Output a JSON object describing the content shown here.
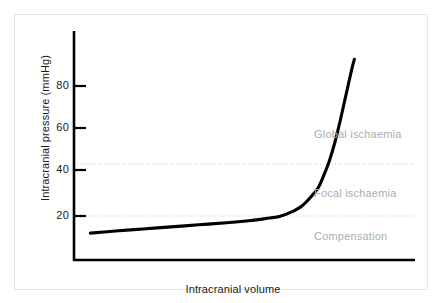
{
  "chart_data": {
    "type": "line",
    "title": "",
    "xlabel": "Intracranial volume",
    "ylabel": "Intracranial pressure (mmHg)",
    "ylim": [
      0,
      100
    ],
    "xlim": [
      0,
      100
    ],
    "grid": false,
    "legend": null,
    "y_ticks": [
      {
        "value": 20,
        "label": "20"
      },
      {
        "value": 40,
        "label": "40"
      },
      {
        "value": 60,
        "label": "60"
      },
      {
        "value": 80,
        "label": "80"
      }
    ],
    "x_ticks": [],
    "series": [
      {
        "name": "Intracranial pressure-volume curve",
        "color": "#000000",
        "points": [
          {
            "x": 3,
            "y": 13
          },
          {
            "x": 12,
            "y": 14
          },
          {
            "x": 22,
            "y": 15
          },
          {
            "x": 32,
            "y": 16
          },
          {
            "x": 42,
            "y": 17
          },
          {
            "x": 52,
            "y": 18
          },
          {
            "x": 60,
            "y": 19
          },
          {
            "x": 66,
            "y": 20
          },
          {
            "x": 71,
            "y": 21
          },
          {
            "x": 75,
            "y": 23
          },
          {
            "x": 79,
            "y": 26
          },
          {
            "x": 82,
            "y": 30
          },
          {
            "x": 85,
            "y": 35
          },
          {
            "x": 87,
            "y": 41
          },
          {
            "x": 89,
            "y": 48
          },
          {
            "x": 91,
            "y": 57
          },
          {
            "x": 93,
            "y": 68
          },
          {
            "x": 95,
            "y": 80
          },
          {
            "x": 97,
            "y": 92
          },
          {
            "x": 98,
            "y": 97
          }
        ]
      }
    ],
    "threshold_lines": [
      {
        "name": "focal-ischaemia-threshold",
        "value": 20,
        "style": "dotted",
        "color": "#c8c8c8"
      },
      {
        "name": "global-ischaemia-threshold",
        "value": 45,
        "style": "dotted",
        "color": "#c8c8c8"
      }
    ],
    "annotations": [
      {
        "name": "global-ischaemia",
        "text": "Global ischaemia",
        "y": 60,
        "color": "#adadad"
      },
      {
        "name": "focal-ischaemia",
        "text": "Focal ischaemia",
        "y": 32,
        "color": "#adadad"
      },
      {
        "name": "compensation",
        "text": "Compensation",
        "y": 12,
        "color": "#adadad"
      }
    ]
  },
  "axes": {
    "y_label": "Intracranial pressure (mmHg)",
    "x_label": "Intracranial volume",
    "tick_80": "80",
    "tick_60": "60",
    "tick_40": "40",
    "tick_20": "20"
  },
  "zones": {
    "global": "Global ischaemia",
    "focal": "Focal ischaemia",
    "compensation": "Compensation"
  },
  "colors": {
    "curve": "#000000",
    "axis": "#000000",
    "threshold": "#c8c8c8",
    "zone_text": "#adadad",
    "frame": "#e6e6e6",
    "background": "#ffffff"
  }
}
